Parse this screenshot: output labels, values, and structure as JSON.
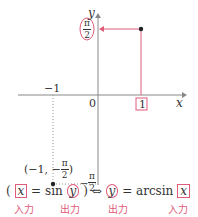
{
  "diagram": {
    "axes": {
      "x_label": "x",
      "y_label": "y",
      "origin_label": "0"
    },
    "ticks": {
      "x_neg_one": "−1",
      "x_one": "1",
      "y_top_num": "π",
      "y_top_den": "2",
      "y_bottom_num": "π",
      "y_bottom_den": "2",
      "y_bottom_sign": "−"
    },
    "points": {
      "upper": {
        "label": "(1, π/2)"
      },
      "lower": {
        "label_prefix": "(−1, −",
        "label_num": "π",
        "label_den": "2",
        "label_suffix": ")"
      }
    },
    "colors": {
      "accent": "#e05a7a",
      "axis": "#888888",
      "text": "#333333"
    }
  },
  "formula": {
    "open_paren": "(",
    "left_x": "x",
    "eq1": " = sin",
    "left_y": "y",
    "close_paren": ")",
    "iff": " ⇔ ",
    "right_y": "y",
    "eq2": " = arcsin",
    "right_x": "x"
  },
  "annotations": {
    "input1": "入力",
    "output1": "出力",
    "output2": "出力",
    "input2": "入力"
  }
}
